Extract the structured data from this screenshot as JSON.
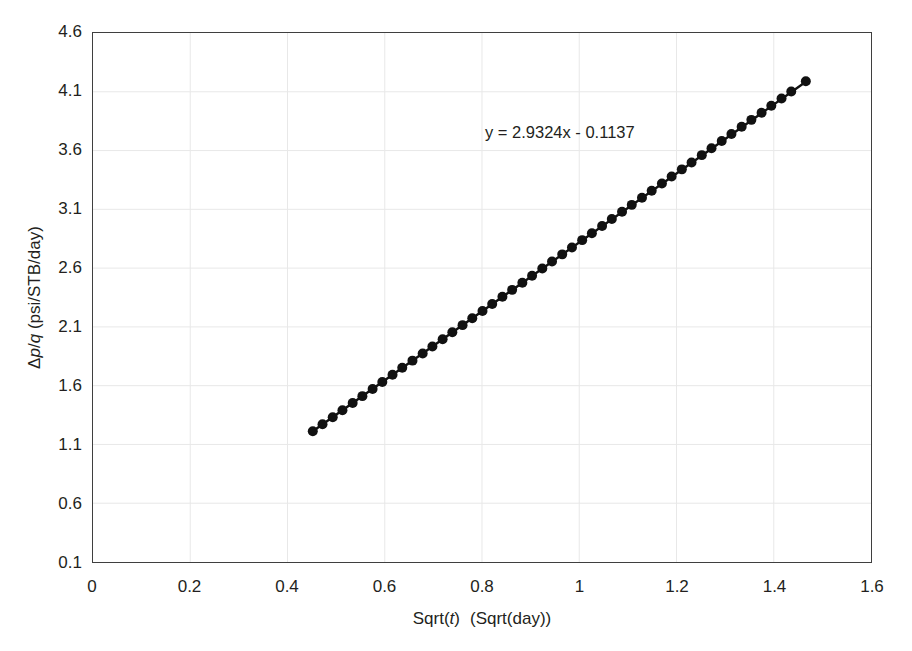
{
  "chart_data": {
    "type": "scatter",
    "title": "",
    "xlabel_parts": {
      "pre": "Sqrt(",
      "var": "t",
      "post": ")",
      "units": "(Sqrt(day))"
    },
    "xlabel": "Sqrt(t)  (Sqrt(day))",
    "ylabel_parts": {
      "d": "Δ",
      "p": "p",
      "slash": "/",
      "q": "q",
      "units": " (psi/STB/day)"
    },
    "ylabel": "Δp/q (psi/STB/day)",
    "xlim": [
      0,
      1.6
    ],
    "ylim": [
      0.1,
      4.6
    ],
    "xticks": [
      0,
      0.2,
      0.4,
      0.6,
      0.8,
      1,
      1.2,
      1.4,
      1.6
    ],
    "xticklabels": [
      "0",
      "0.2",
      "0.4",
      "0.6",
      "0.8",
      "1",
      "1.2",
      "1.4",
      "1.6"
    ],
    "yticks": [
      0.1,
      0.6,
      1.1,
      1.6,
      2.1,
      2.6,
      3.1,
      3.6,
      4.1,
      4.6
    ],
    "yticklabels": [
      "0.1",
      "0.6",
      "1.1",
      "1.6",
      "2.1",
      "2.6",
      "3.1",
      "3.6",
      "4.1",
      "4.6"
    ],
    "grid": true,
    "grid_color": "#e8e8e8",
    "legend": "none",
    "marker_color": "#111111",
    "line_color": "#111111",
    "marker_size": 5,
    "line_width": 2.4,
    "annotations": [
      {
        "text": "y = 2.9324x - 0.1137",
        "x": 0.81,
        "y": 3.82
      }
    ],
    "trendline": {
      "slope": 2.9324,
      "intercept": -0.1137,
      "x_start": 0.452,
      "x_end": 1.466
    },
    "x": [
      0.452,
      0.472,
      0.493,
      0.513,
      0.534,
      0.554,
      0.575,
      0.595,
      0.616,
      0.636,
      0.657,
      0.678,
      0.698,
      0.719,
      0.739,
      0.76,
      0.78,
      0.801,
      0.821,
      0.842,
      0.862,
      0.883,
      0.903,
      0.924,
      0.944,
      0.965,
      0.985,
      1.006,
      1.026,
      1.047,
      1.067,
      1.088,
      1.108,
      1.129,
      1.149,
      1.17,
      1.19,
      1.211,
      1.231,
      1.252,
      1.272,
      1.293,
      1.313,
      1.334,
      1.354,
      1.375,
      1.395,
      1.416,
      1.436,
      1.466
    ],
    "y": [
      1.212,
      1.271,
      1.332,
      1.391,
      1.452,
      1.511,
      1.572,
      1.631,
      1.693,
      1.752,
      1.813,
      1.874,
      1.933,
      1.995,
      2.054,
      2.115,
      2.174,
      2.236,
      2.295,
      2.356,
      2.415,
      2.476,
      2.535,
      2.597,
      2.656,
      2.717,
      2.776,
      2.838,
      2.897,
      2.958,
      3.017,
      3.079,
      3.138,
      3.199,
      3.258,
      3.32,
      3.379,
      3.44,
      3.499,
      3.561,
      3.62,
      3.681,
      3.74,
      3.802,
      3.861,
      3.922,
      3.981,
      4.043,
      4.102,
      4.19
    ]
  },
  "axis": {
    "frame_color": "#3f3f3f",
    "background": "#ffffff"
  }
}
